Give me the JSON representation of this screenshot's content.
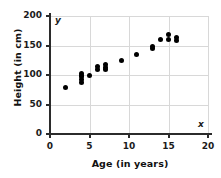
{
  "chart_data": {
    "type": "scatter",
    "title": "",
    "xlabel": "Age (in years)",
    "ylabel": "Height (in cm)",
    "xlim": [
      0,
      20
    ],
    "ylim": [
      0,
      200
    ],
    "xticks": [
      0,
      5,
      10,
      15,
      20
    ],
    "yticks": [
      0,
      50,
      100,
      150,
      200
    ],
    "xtick_labels": [
      "0",
      "5",
      "10",
      "15",
      "20"
    ],
    "ytick_labels": [
      "0",
      "50",
      "100",
      "150",
      "200"
    ],
    "grid": true,
    "legend": false,
    "axis_letter_x": "x",
    "axis_letter_y": "y",
    "marker_color": "#000000",
    "grid_color": "#d8d8d8",
    "axis_color": "#2b2b2b",
    "points": [
      {
        "x": 2.0,
        "y": 79
      },
      {
        "x": 4.0,
        "y": 88
      },
      {
        "x": 4.0,
        "y": 92
      },
      {
        "x": 4.0,
        "y": 97
      },
      {
        "x": 4.0,
        "y": 100
      },
      {
        "x": 4.0,
        "y": 103
      },
      {
        "x": 5.0,
        "y": 99
      },
      {
        "x": 6.0,
        "y": 110
      },
      {
        "x": 6.0,
        "y": 114
      },
      {
        "x": 7.0,
        "y": 109
      },
      {
        "x": 7.0,
        "y": 113
      },
      {
        "x": 7.0,
        "y": 117
      },
      {
        "x": 9.0,
        "y": 124
      },
      {
        "x": 11.0,
        "y": 134
      },
      {
        "x": 13.0,
        "y": 145
      },
      {
        "x": 13.0,
        "y": 149
      },
      {
        "x": 14.0,
        "y": 160
      },
      {
        "x": 15.0,
        "y": 160
      },
      {
        "x": 15.0,
        "y": 169
      },
      {
        "x": 16.0,
        "y": 159
      },
      {
        "x": 16.0,
        "y": 163
      }
    ]
  }
}
